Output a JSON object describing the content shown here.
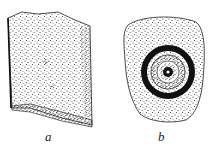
{
  "figure": {
    "items": [
      {
        "label": "a",
        "description": "stippled rectangular block fragment"
      },
      {
        "label": "b",
        "description": "stippled rounded stone with concentric ring and central hole"
      }
    ],
    "colors": {
      "ink": "#1a1a1a",
      "paper": "#ffffff"
    }
  }
}
